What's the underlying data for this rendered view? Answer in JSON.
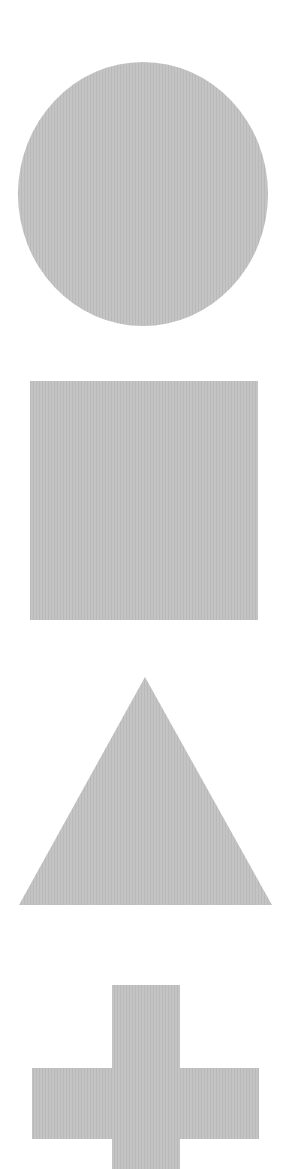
{
  "canvas": {
    "width": 305,
    "height": 1169,
    "background": "#ffffff"
  },
  "style": {
    "fill": "#c4c4c4",
    "stripe": "#b9b9b9"
  },
  "shapes": [
    {
      "name": "circle",
      "type": "circle",
      "cx": 143,
      "cy": 194,
      "rx": 125,
      "ry": 132
    },
    {
      "name": "square",
      "type": "rect",
      "x": 30,
      "y": 381,
      "width": 228,
      "height": 239
    },
    {
      "name": "triangle",
      "type": "polygon",
      "points": "145,677 272,905 19,905"
    },
    {
      "name": "cross",
      "type": "polygon",
      "points": "112,985 180,985 180,1068 259,1068 259,1139 180,1139 180,1169 112,1169 112,1139 32,1139 32,1068 112,1068"
    }
  ]
}
